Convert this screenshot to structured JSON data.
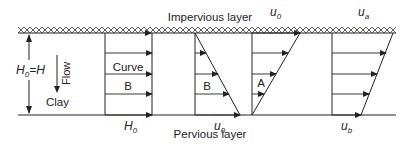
{
  "diagram": {
    "layers": {
      "top_label": "Impervious layer",
      "bottom_label": "Pervious layer",
      "soil_label": "Clay"
    },
    "left_dimension": {
      "label_main": "H",
      "label_sub": "0",
      "label_rest": "=H"
    },
    "flow_label": "Flow",
    "panels": [
      {
        "id": "panel-1",
        "name": "Curve B",
        "label_line1": "Curve",
        "label_line2": "B",
        "bottom_label_main": "H",
        "bottom_label_sub": "0"
      },
      {
        "id": "panel-2",
        "name": "B",
        "label": "B",
        "bottom_label_main": "u",
        "bottom_label_sub": "0"
      },
      {
        "id": "panel-3",
        "name": "A",
        "label": "A",
        "top_label_main": "u",
        "top_label_sub": "0"
      },
      {
        "id": "panel-4",
        "name": "trapezoid",
        "top_label_main": "u",
        "top_label_sub": "a",
        "bottom_label_main": "u",
        "bottom_label_sub": "b"
      }
    ],
    "colors": {
      "line": "#222222",
      "background": "#ffffff"
    }
  }
}
